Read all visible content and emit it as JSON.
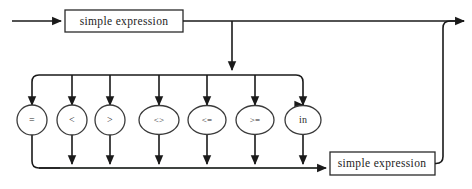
{
  "diagram": {
    "type": "railroad-syntax-diagram",
    "name": "expression",
    "background_color": "#ffffff",
    "line_color": "#1a1a1a",
    "text_color": "#1c1c1c"
  },
  "terminals": {
    "left_operand_label": "simple expression",
    "right_operand_label": "simple expression"
  },
  "operators": [
    {
      "id": "eq",
      "label": "=",
      "center_x": 32,
      "shape": "circle"
    },
    {
      "id": "lt",
      "label": "<",
      "center_x": 72,
      "shape": "circle"
    },
    {
      "id": "gt",
      "label": ">",
      "center_x": 110,
      "shape": "circle"
    },
    {
      "id": "ne",
      "label": "<>",
      "center_x": 159,
      "shape": "ellipse"
    },
    {
      "id": "le",
      "label": "<=",
      "center_x": 207,
      "shape": "ellipse"
    },
    {
      "id": "ge",
      "label": ">=",
      "center_x": 255,
      "shape": "ellipse"
    },
    {
      "id": "in",
      "label": "in",
      "center_x": 303,
      "shape": "ellipse"
    }
  ],
  "geometry": {
    "top_rail_y": 21,
    "distribution_bar_y": 75,
    "operator_center_y": 120,
    "bottom_rail_y": 168,
    "entry_x": 12,
    "exit_x": 468,
    "branch_drop_x": 232,
    "return_x": 443,
    "left_box": {
      "x": 65,
      "y": 10,
      "w": 118,
      "h": 22
    },
    "right_box": {
      "x": 330,
      "y": 152,
      "w": 105,
      "h": 23
    },
    "corner_radius": 7
  }
}
